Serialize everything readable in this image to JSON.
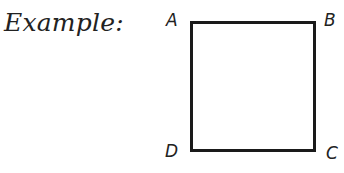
{
  "caption": "Example:",
  "figure": {
    "shape": "square",
    "vertices": [
      {
        "label": "A",
        "position": "top-left"
      },
      {
        "label": "B",
        "position": "top-right"
      },
      {
        "label": "C",
        "position": "bottom-right"
      },
      {
        "label": "D",
        "position": "bottom-left"
      }
    ],
    "stroke_color": "#1a1a1a"
  }
}
